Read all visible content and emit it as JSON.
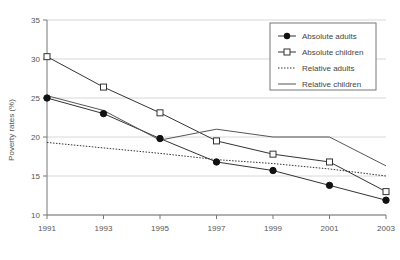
{
  "chart_data": {
    "type": "line",
    "title": "",
    "xlabel": "",
    "ylabel": "Poverty rates (%)",
    "categories": [
      1991,
      1993,
      1995,
      1997,
      1999,
      2001,
      2003
    ],
    "xtick_labels": [
      "1991",
      "1993",
      "1995",
      "1997",
      "1999",
      "2001",
      "2003"
    ],
    "ytick_labels": [
      "10",
      "15",
      "20",
      "25",
      "30",
      "35"
    ],
    "yticks": [
      10,
      15,
      20,
      25,
      30,
      35
    ],
    "ylim": [
      10,
      35
    ],
    "xlim": [
      1991,
      2003
    ],
    "grid": "horizontal",
    "legend_position": "top-right",
    "series": [
      {
        "name": "Absolute adults",
        "marker": "filled-circle",
        "line": "solid",
        "color": "#333333",
        "values": [
          25.0,
          23.0,
          19.8,
          16.8,
          15.7,
          13.8,
          11.9
        ]
      },
      {
        "name": "Absolute children",
        "marker": "open-square",
        "line": "solid",
        "color": "#333333",
        "values": [
          30.3,
          26.4,
          23.1,
          19.5,
          17.8,
          16.8,
          13.0
        ]
      },
      {
        "name": "Relative adults",
        "marker": "none",
        "line": "dotted",
        "color": "#333333",
        "values": [
          19.3,
          18.6,
          17.9,
          17.1,
          16.6,
          15.9,
          15.0
        ]
      },
      {
        "name": "Relative children",
        "marker": "none",
        "line": "solid",
        "color": "#555555",
        "values": [
          25.3,
          23.4,
          19.6,
          21.0,
          20.0,
          20.0,
          16.3
        ]
      }
    ]
  },
  "legend": {
    "items": [
      {
        "label": "Absolute adults",
        "key": "absolute-adults"
      },
      {
        "label": "Absolute children",
        "key": "absolute-children"
      },
      {
        "label": "Relative adults",
        "key": "relative-adults"
      },
      {
        "label": "Relative children",
        "key": "relative-children"
      }
    ]
  }
}
